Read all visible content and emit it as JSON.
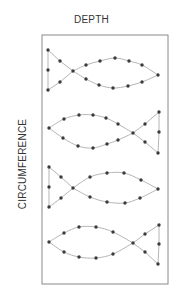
{
  "labels": {
    "top": "DEPTH",
    "side": "CIRCUMFERENCE"
  },
  "colors": {
    "frame": "#8a8a8a",
    "curve": "#b5b5b5",
    "dot": "#3a3a3a",
    "text": "#333333"
  },
  "frame": {
    "x": 42,
    "y": 35,
    "width": 126,
    "height": 249
  },
  "fish": [
    {
      "name": "fish-1",
      "orientation": "tail-left",
      "tail": [
        [
          48,
          50
        ],
        [
          48,
          70
        ],
        [
          48,
          90
        ]
      ],
      "tail_inner": [
        [
          60,
          61
        ],
        [
          60,
          82
        ]
      ],
      "crossing": [
        73,
        71
      ],
      "top_arc": [
        [
          86,
          65
        ],
        [
          100,
          61
        ],
        [
          115,
          58
        ],
        [
          129,
          61
        ],
        [
          142,
          65
        ]
      ],
      "bottom_arc": [
        [
          86,
          79
        ],
        [
          99,
          85
        ],
        [
          113,
          88
        ],
        [
          128,
          86
        ],
        [
          142,
          82
        ]
      ],
      "nose": [
        158,
        75
      ]
    },
    {
      "name": "fish-2",
      "orientation": "tail-right",
      "nose": [
        49,
        128
      ],
      "top_arc": [
        [
          64,
          119
        ],
        [
          79,
          115
        ],
        [
          93,
          115
        ],
        [
          106,
          118
        ],
        [
          118,
          124
        ]
      ],
      "bottom_arc": [
        [
          63,
          138
        ],
        [
          78,
          146
        ],
        [
          93,
          148
        ],
        [
          107,
          144
        ],
        [
          118,
          140
        ]
      ],
      "crossing": [
        133,
        133
      ],
      "tail_inner": [
        [
          145,
          124
        ],
        [
          145,
          142
        ]
      ],
      "tail": [
        [
          159,
          112
        ],
        [
          159,
          132
        ],
        [
          158,
          153
        ]
      ]
    },
    {
      "name": "fish-3",
      "orientation": "tail-left",
      "tail": [
        [
          49,
          167
        ],
        [
          49,
          187
        ],
        [
          49,
          207
        ]
      ],
      "tail_inner": [
        [
          61,
          177
        ],
        [
          61,
          198
        ]
      ],
      "crossing": [
        73,
        188
      ],
      "top_arc": [
        [
          90,
          177
        ],
        [
          107,
          173
        ],
        [
          124,
          173
        ],
        [
          141,
          180
        ]
      ],
      "bottom_arc": [
        [
          90,
          197
        ],
        [
          107,
          202
        ],
        [
          125,
          203
        ],
        [
          140,
          198
        ]
      ],
      "nose": [
        158,
        189
      ]
    },
    {
      "name": "fish-4",
      "orientation": "tail-right",
      "nose": [
        49,
        242
      ],
      "top_arc": [
        [
          64,
          233
        ],
        [
          79,
          227
        ],
        [
          96,
          227
        ],
        [
          113,
          232
        ]
      ],
      "bottom_arc": [
        [
          64,
          252
        ],
        [
          79,
          257
        ],
        [
          96,
          258
        ],
        [
          113,
          254
        ]
      ],
      "crossing": [
        133,
        243
      ],
      "tail_inner": [
        [
          145,
          234
        ],
        [
          145,
          252
        ]
      ],
      "tail": [
        [
          159,
          225
        ],
        [
          159,
          244
        ],
        [
          158,
          264
        ]
      ]
    }
  ]
}
